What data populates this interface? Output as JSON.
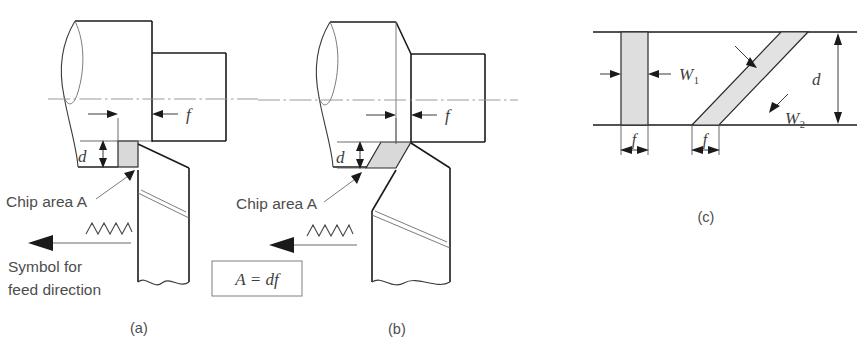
{
  "figure": {
    "kind": "engineering-diagram",
    "colors": {
      "outline": "#1a1a1a",
      "thin_outline": "#3a3a3a",
      "hairline": "#6d6d6d",
      "centerline": "#8f8f96",
      "chip_fill": "#d9d9d9",
      "chip_fill_light": "#e2e2e2",
      "text": "#4d4d4d",
      "background": "#ffffff"
    }
  },
  "panels": [
    {
      "id": "a",
      "caption": "(a)",
      "labels": {
        "feed": "f",
        "depth": "d",
        "chip_area": "Chip area A",
        "feed_symbol_line1": "Symbol for",
        "feed_symbol_line2": "feed direction"
      }
    },
    {
      "id": "b",
      "caption": "(b)",
      "labels": {
        "feed": "f",
        "depth": "d",
        "chip_area": "Chip area A"
      }
    },
    {
      "id": "c",
      "caption": "(c)",
      "labels": {
        "width1": "W",
        "width1_sub": "1",
        "width2": "W",
        "width2_sub": "2",
        "depth": "d",
        "feed_left": "f",
        "feed_right": "f"
      }
    }
  ],
  "equation": {
    "text": "A = df",
    "area_symbol": "A",
    "equals": "=",
    "depth_symbol": "d",
    "feed_symbol": "f"
  }
}
